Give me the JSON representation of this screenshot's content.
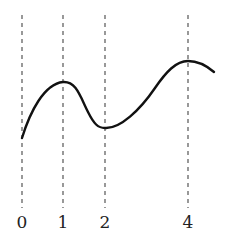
{
  "diagram": {
    "markers": [
      {
        "label": "0",
        "x": 22
      },
      {
        "label": "1",
        "x": 63
      },
      {
        "label": "2",
        "x": 105
      },
      {
        "label": "4",
        "x": 188
      }
    ],
    "curve": {
      "color": "#111111",
      "features": [
        "start at 0",
        "local maximum at 1",
        "local minimum at 2",
        "local maximum at 4"
      ]
    },
    "line_color": "#555555"
  }
}
